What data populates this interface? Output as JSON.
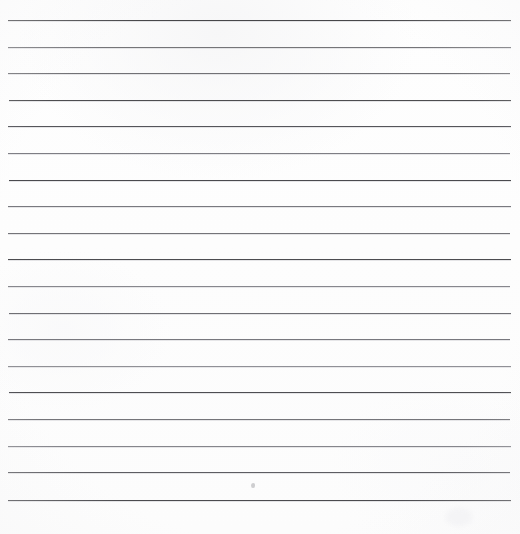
{
  "document": {
    "kind": "scanned-lined-paper",
    "title": "Blank ruled notebook page",
    "description": "Scanned sheet of blank lined writing paper with horizontal ruled lines and no handwritten text.",
    "page_text": "",
    "width": 520,
    "height": 534,
    "background_color": "#fdfdfd",
    "line_count": 19
  },
  "ruling": {
    "left_margin_px": 8,
    "right_edge_px": 511,
    "first_line_y_px": 20,
    "line_spacing_px": 26.7,
    "line_thickness_px": 1,
    "base_line_color": "#4f4f52",
    "lines": [
      {
        "index": 1,
        "y": 20,
        "x1": 8,
        "x2": 511,
        "color": "#47474a",
        "opacity": 1.0
      },
      {
        "index": 2,
        "y": 47,
        "x1": 8,
        "x2": 511,
        "color": "#6e6e72",
        "opacity": 0.95
      },
      {
        "index": 3,
        "y": 73,
        "x1": 8,
        "x2": 510,
        "color": "#6a6a6e",
        "opacity": 0.95
      },
      {
        "index": 4,
        "y": 100,
        "x1": 9,
        "x2": 511,
        "color": "#4d4d50",
        "opacity": 1.0
      },
      {
        "index": 5,
        "y": 126,
        "x1": 8,
        "x2": 511,
        "color": "#55555a",
        "opacity": 1.0
      },
      {
        "index": 6,
        "y": 153,
        "x1": 8,
        "x2": 510,
        "color": "#74747a",
        "opacity": 0.92
      },
      {
        "index": 7,
        "y": 180,
        "x1": 9,
        "x2": 511,
        "color": "#4a4a4e",
        "opacity": 1.0
      },
      {
        "index": 8,
        "y": 206,
        "x1": 8,
        "x2": 511,
        "color": "#707076",
        "opacity": 0.93
      },
      {
        "index": 9,
        "y": 233,
        "x1": 8,
        "x2": 510,
        "color": "#6c6c71",
        "opacity": 0.94
      },
      {
        "index": 10,
        "y": 259,
        "x1": 8,
        "x2": 511,
        "color": "#4c4c50",
        "opacity": 1.0
      },
      {
        "index": 11,
        "y": 286,
        "x1": 8,
        "x2": 510,
        "color": "#7b7b81",
        "opacity": 0.9
      },
      {
        "index": 12,
        "y": 313,
        "x1": 9,
        "x2": 511,
        "color": "#68686d",
        "opacity": 0.95
      },
      {
        "index": 13,
        "y": 339,
        "x1": 8,
        "x2": 510,
        "color": "#6f6f75",
        "opacity": 0.93
      },
      {
        "index": 14,
        "y": 366,
        "x1": 8,
        "x2": 511,
        "color": "#828288",
        "opacity": 0.88
      },
      {
        "index": 15,
        "y": 392,
        "x1": 9,
        "x2": 511,
        "color": "#4e4e52",
        "opacity": 1.0
      },
      {
        "index": 16,
        "y": 419,
        "x1": 8,
        "x2": 510,
        "color": "#6d6d72",
        "opacity": 0.94
      },
      {
        "index": 17,
        "y": 446,
        "x1": 8,
        "x2": 511,
        "color": "#79797f",
        "opacity": 0.9
      },
      {
        "index": 18,
        "y": 472,
        "x1": 8,
        "x2": 510,
        "color": "#5a5a5f",
        "opacity": 0.98
      },
      {
        "index": 19,
        "y": 500,
        "x1": 8,
        "x2": 511,
        "color": "#4b4b4f",
        "opacity": 1.0
      }
    ]
  },
  "marks": {
    "pencil_dot": {
      "x": 251,
      "y": 483,
      "label": "faint pencil dot"
    },
    "smudge": {
      "x": 446,
      "y": 508,
      "label": "faint paper smudge"
    }
  }
}
